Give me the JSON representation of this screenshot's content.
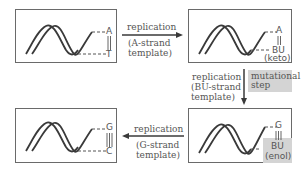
{
  "panels": {
    "top_left": {
      "top_base": "A",
      "bottom_base": "T",
      "bond": "double"
    },
    "top_right": {
      "top_base": "A",
      "bottom_base": "BU",
      "tautomer": "(keto)",
      "bond": "double"
    },
    "bottom_right": {
      "top_base": "G",
      "bottom_base": "BU",
      "tautomer": "(enol)",
      "bond": "triple",
      "highlighted": true
    },
    "bottom_left": {
      "top_base": "G",
      "bottom_base": "C",
      "bond": "triple"
    }
  },
  "arrows": {
    "a_strand": {
      "line1": "replication",
      "line2": "(A-strand",
      "line3": "template)",
      "direction": "right"
    },
    "bu_strand": {
      "line1": "replication",
      "line2": "(BU-strand",
      "line3": "template)",
      "direction": "down"
    },
    "g_strand": {
      "line1": "replication",
      "line2": "(G-strand",
      "line3": "template)",
      "direction": "left"
    }
  },
  "mutational_step": {
    "line1": "mutational",
    "line2": "step"
  },
  "colors": {
    "stroke": "#3a3a3a",
    "box_border": "#6a6a6a",
    "highlight": "#d4d4d4",
    "text": "#555555"
  }
}
